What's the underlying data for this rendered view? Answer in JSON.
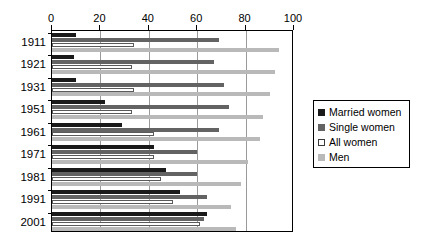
{
  "chart_data": {
    "type": "bar",
    "orientation": "horizontal",
    "title": "",
    "subtitle": "",
    "xlabel": "",
    "ylabel": "",
    "xlim": [
      0,
      100
    ],
    "xticks": [
      0,
      20,
      40,
      60,
      80,
      100
    ],
    "xtick_labels": [
      "0",
      "20",
      "40",
      "60",
      "80",
      "100"
    ],
    "grid": true,
    "grid_axis": "x",
    "legend_position": "right",
    "categories": [
      "1911",
      "1921",
      "1931",
      "1951",
      "1961",
      "1971",
      "1981",
      "1991",
      "2001"
    ],
    "series": [
      {
        "name": "Married women",
        "color": "#1a1a1a",
        "values": [
          10,
          9,
          10,
          22,
          29,
          42,
          47,
          53,
          64
        ]
      },
      {
        "name": "Single women",
        "color": "#636363",
        "values": [
          69,
          67,
          71,
          73,
          69,
          60,
          60,
          64,
          63
        ]
      },
      {
        "name": "All women",
        "color": "#ffffff",
        "values": [
          34,
          33,
          34,
          33,
          42,
          42,
          45,
          50,
          61
        ]
      },
      {
        "name": "Men",
        "color": "#b9b9b9",
        "values": [
          94,
          92,
          90,
          87,
          86,
          81,
          78,
          74,
          76
        ]
      }
    ]
  },
  "legend": {
    "items": [
      {
        "label": "Married women",
        "swatch": "married"
      },
      {
        "label": "Single women",
        "swatch": "single"
      },
      {
        "label": "All women",
        "swatch": "all"
      },
      {
        "label": "Men",
        "swatch": "men"
      }
    ]
  }
}
